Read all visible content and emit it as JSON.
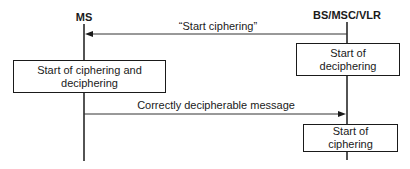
{
  "diagram": {
    "type": "sequence",
    "participants": [
      {
        "id": "ms",
        "label": "MS"
      },
      {
        "id": "bs",
        "label": "BS/MSC/VLR"
      }
    ],
    "messages": [
      {
        "from": "BS/MSC/VLR",
        "to": "MS",
        "label": "“Start ciphering”"
      },
      {
        "from": "MS",
        "to": "BS/MSC/VLR",
        "label": "Correctly decipherable message"
      }
    ],
    "activities": [
      {
        "participant": "BS/MSC/VLR",
        "lines": [
          "Start of",
          "deciphering"
        ]
      },
      {
        "participant": "MS",
        "lines": [
          "Start of ciphering and",
          "deciphering"
        ]
      },
      {
        "participant": "BS/MSC/VLR",
        "lines": [
          "Start of",
          "ciphering"
        ]
      }
    ],
    "colors": {
      "line": "#1a1a1a",
      "background": "#ffffff"
    }
  }
}
